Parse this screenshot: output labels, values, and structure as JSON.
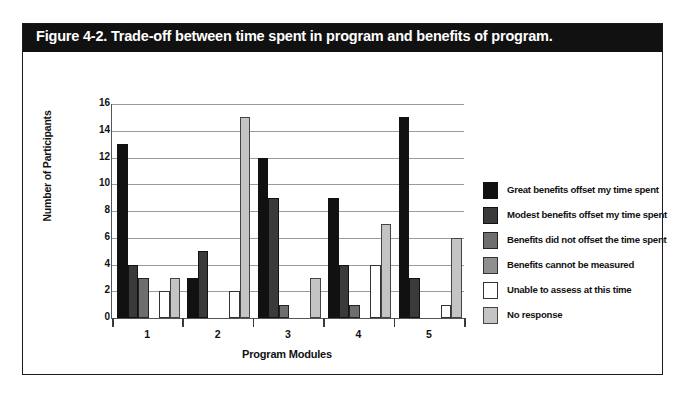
{
  "figure": {
    "title": "Figure 4-2. Trade-off between time spent in program and benefits of program."
  },
  "chart_data": {
    "type": "bar",
    "title": "Figure 4-2. Trade-off between time spent in program and benefits of program.",
    "xlabel": "Program Modules",
    "ylabel": "Number of Participants",
    "categories": [
      "1",
      "2",
      "3",
      "4",
      "5"
    ],
    "ylim": [
      0,
      16
    ],
    "yticks": [
      0,
      2,
      4,
      6,
      8,
      10,
      12,
      14,
      16
    ],
    "ytick_labels": [
      "0",
      "2",
      "4",
      "6",
      "8",
      "10",
      "12",
      "14",
      "16"
    ],
    "grid": true,
    "legend_position": "right",
    "series": [
      {
        "name": "Great benefits offset my time spent",
        "color": "#111111",
        "border": "#111111",
        "values": [
          13,
          3,
          12,
          9,
          15
        ]
      },
      {
        "name": "Modest benefits offset my time spent",
        "color": "#3a3a3a",
        "border": "#111111",
        "values": [
          4,
          5,
          9,
          4,
          3
        ]
      },
      {
        "name": "Benefits did not offset the time spent",
        "color": "#6e6e6e",
        "border": "#222222",
        "values": [
          3,
          0,
          1,
          1,
          0
        ]
      },
      {
        "name": "Benefits cannot be measured",
        "color": "#8f8f8f",
        "border": "#333333",
        "values": [
          0,
          0,
          0,
          0,
          0
        ]
      },
      {
        "name": "Unable to assess at this time",
        "color": "#ffffff",
        "border": "#333333",
        "values": [
          2,
          2,
          0,
          4,
          1
        ]
      },
      {
        "name": "No response",
        "color": "#c4c4c4",
        "border": "#444444",
        "values": [
          3,
          15,
          3,
          7,
          6
        ]
      }
    ]
  }
}
